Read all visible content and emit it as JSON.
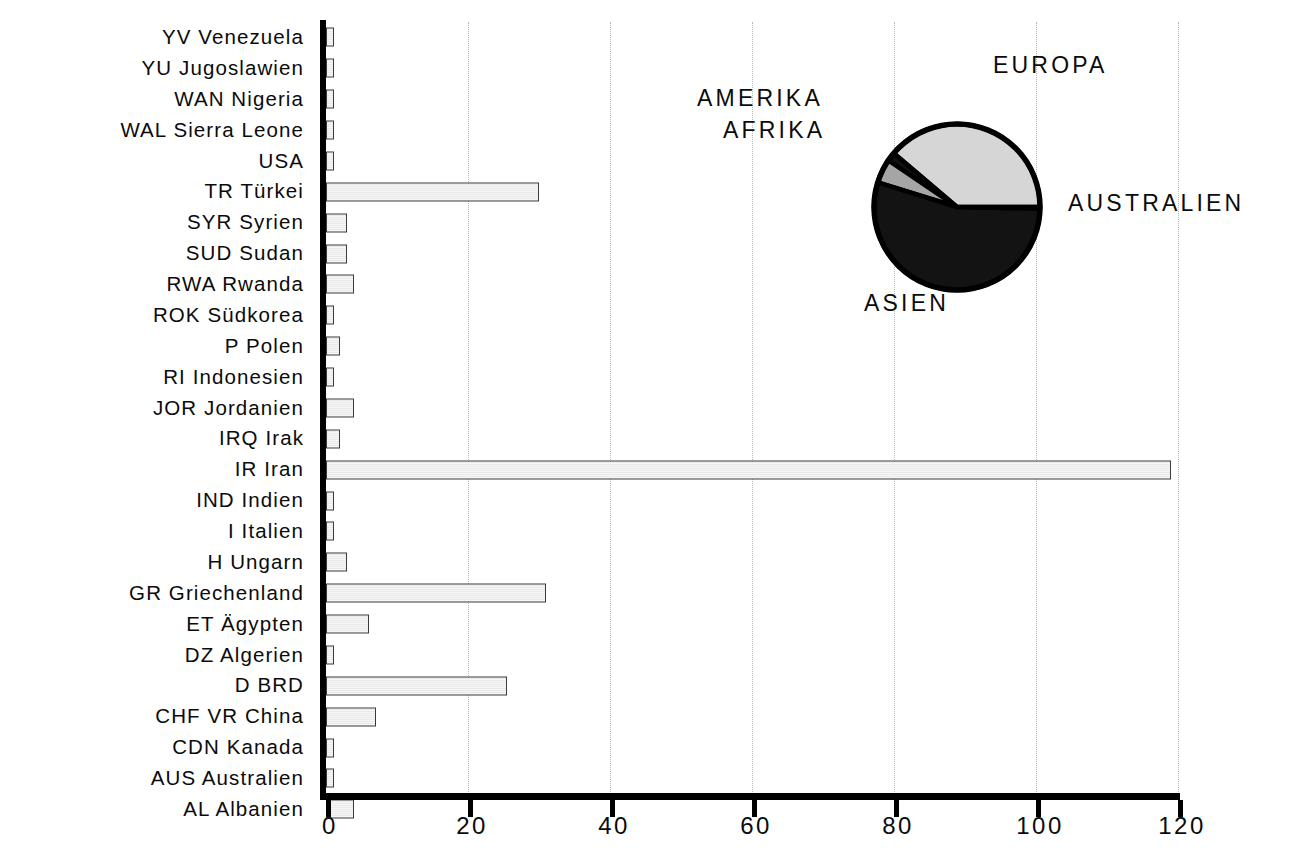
{
  "chart_data": [
    {
      "type": "bar",
      "orientation": "horizontal",
      "title": "",
      "xlabel": "",
      "ylabel": "",
      "xlim": [
        0,
        120
      ],
      "xticks": [
        0,
        20,
        40,
        60,
        80,
        100,
        120
      ],
      "xtick_labels": [
        "0",
        "20",
        "40",
        "60",
        "80",
        "100",
        "120"
      ],
      "grid": true,
      "grid_axis": "x",
      "grid_style": "dotted",
      "categories": [
        "YV Venezuela",
        "YU Jugoslawien",
        "WAN Nigeria",
        "WAL Sierra Leone",
        "USA",
        "TR Türkei",
        "SYR Syrien",
        "SUD Sudan",
        "RWA Rwanda",
        "ROK Südkorea",
        "P Polen",
        "RI Indonesien",
        "JOR Jordanien",
        "IRQ Irak",
        "IR Iran",
        "IND Indien",
        "I Italien",
        "H Ungarn",
        "GR Griechenland",
        "ET Ägypten",
        "DZ Algerien",
        "D BRD",
        "CHF VR China",
        "CDN Kanada",
        "AUS Australien",
        "AL Albanien"
      ],
      "values": [
        1,
        1,
        1,
        1,
        1,
        30,
        3,
        3,
        4,
        1,
        2,
        1,
        4,
        2,
        119,
        1,
        1,
        3,
        31,
        6,
        1,
        25.5,
        7,
        1,
        1,
        4
      ],
      "bar_fill": "#efefef",
      "bar_edge": "#3a3a3a",
      "axis_color": "#000000"
    },
    {
      "type": "pie",
      "title": "",
      "labels": [
        "EUROPA",
        "AMERIKA",
        "AFRIKA",
        "ASIEN",
        "AUSTRALIEN"
      ],
      "values": [
        38.8,
        1.7,
        4.7,
        54.5,
        0.3
      ],
      "colors": [
        "#d6d6d6",
        "#111111",
        "#a5a5a5",
        "#131313",
        "#ffffff"
      ],
      "edge_color": "#000000",
      "start_angle": 0,
      "direction": "counterclockwise",
      "legend": "labels-outside"
    }
  ],
  "axis": {
    "xticks": [
      {
        "label": "0",
        "value": 0
      },
      {
        "label": "20",
        "value": 20
      },
      {
        "label": "40",
        "value": 40
      },
      {
        "label": "60",
        "value": 60
      },
      {
        "label": "80",
        "value": 80
      },
      {
        "label": "100",
        "value": 100
      },
      {
        "label": "120",
        "value": 120
      }
    ]
  },
  "pie_labels": {
    "europa": "EUROPA",
    "amerika": "AMERIKA",
    "afrika": "AFRIKA",
    "australien": "AUSTRALIEN",
    "asien": "ASIEN"
  }
}
